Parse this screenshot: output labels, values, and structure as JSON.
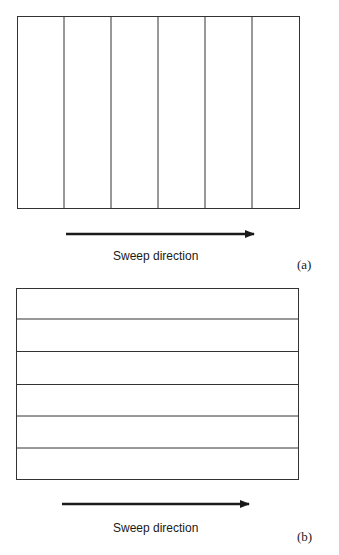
{
  "panels": [
    {
      "id": "a",
      "orientation": "vertical",
      "strips": 6,
      "caption": "Sweep direction",
      "label": "(a)"
    },
    {
      "id": "b",
      "orientation": "horizontal",
      "strips": 6,
      "caption": "Sweep direction",
      "label": "(b)"
    }
  ],
  "colors": {
    "line": "#333333",
    "arrow": "#1a1a1a"
  }
}
